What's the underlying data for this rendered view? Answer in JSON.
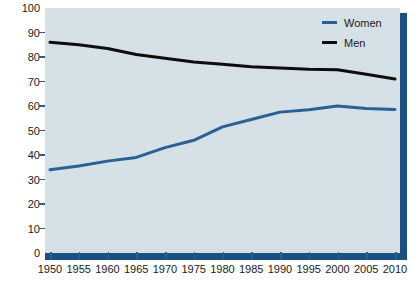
{
  "chart_data": {
    "type": "line",
    "title": "",
    "subtitle": "",
    "xlabel": "",
    "ylabel": "",
    "xlim": [
      1950,
      2010
    ],
    "ylim": [
      0,
      100
    ],
    "grid": false,
    "legend_position": "top-right",
    "x": [
      1950,
      1955,
      1960,
      1965,
      1970,
      1975,
      1980,
      1985,
      1990,
      1995,
      2000,
      2005,
      2010
    ],
    "categories": [
      "1950",
      "1955",
      "1960",
      "1965",
      "1970",
      "1975",
      "1980",
      "1985",
      "1990",
      "1995",
      "2000",
      "2005",
      "2010"
    ],
    "series": [
      {
        "name": "Women",
        "color": "#2a6094",
        "values": [
          34,
          35.5,
          37.5,
          39,
          43,
          46,
          51.5,
          54.5,
          57.5,
          58.5,
          60,
          59,
          58.6
        ]
      },
      {
        "name": "Men",
        "color": "#0d0d0d",
        "values": [
          86,
          85,
          83.5,
          81,
          79.5,
          78,
          77,
          76,
          75.5,
          75,
          74.8,
          73,
          71
        ]
      }
    ],
    "ytick_values": [
      0,
      10,
      20,
      30,
      40,
      50,
      60,
      70,
      80,
      90,
      100
    ],
    "ytick_labels": [
      "0",
      "10",
      "20",
      "30",
      "40",
      "50",
      "60",
      "70",
      "80",
      "90",
      "100"
    ]
  },
  "legend": {
    "items": [
      {
        "label": "Women",
        "color": "#2a6094"
      },
      {
        "label": "Men",
        "color": "#0d0d0d"
      }
    ]
  },
  "style": {
    "plot_background": "#d5e0e7",
    "frame_color": "#1d4f7c",
    "tick_color": "#2b5f8e",
    "text_color": "#1a1a1a",
    "page_background": "#ffffff"
  }
}
